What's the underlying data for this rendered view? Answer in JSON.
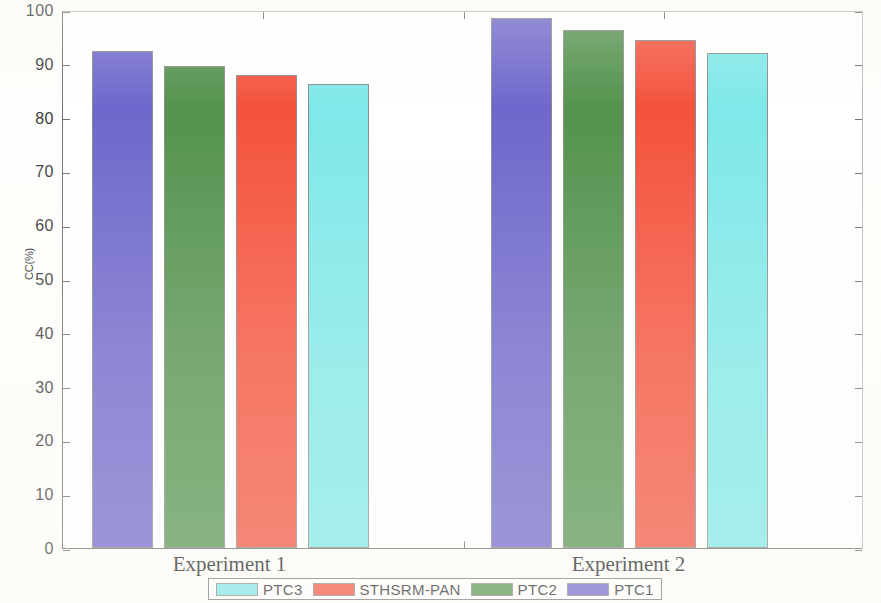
{
  "chart_data": {
    "type": "bar",
    "title": "",
    "xlabel": "",
    "ylabel": "CC(%)",
    "categories": [
      "Experiment 1",
      "Experiment 2"
    ],
    "ylim": [
      0,
      100
    ],
    "yticks": [
      0,
      10,
      20,
      30,
      40,
      50,
      60,
      70,
      80,
      90,
      100
    ],
    "ytick_labels": [
      "0",
      "10",
      "20",
      "30",
      "40",
      "50",
      "60",
      "70",
      "80",
      "90",
      "100"
    ],
    "grid": false,
    "legend_position": "bottom-outside",
    "bar_order_in_group": [
      "PTC1",
      "PTC2",
      "STHSRM-PAN",
      "PTC3"
    ],
    "series": [
      {
        "name": "PTC3",
        "color": "#7FE8E8",
        "values": [
          86.2,
          92.0
        ]
      },
      {
        "name": "STHSRM-PAN",
        "color": "#F4523C",
        "values": [
          88.0,
          94.4
        ]
      },
      {
        "name": "PTC2",
        "color": "#54924E",
        "values": [
          89.6,
          96.3
        ]
      },
      {
        "name": "PTC1",
        "color": "#6F67CB",
        "values": [
          92.3,
          98.5
        ]
      }
    ]
  },
  "axis": {
    "ytick_labels": [
      "100",
      "90",
      "80",
      "70",
      "60",
      "50",
      "40",
      "30",
      "20",
      "10",
      "0"
    ],
    "ylabel": "CC(%)",
    "xcat_1": "Experiment 1",
    "xcat_2": "Experiment 2"
  },
  "legend": {
    "items": [
      {
        "label": "PTC3",
        "color": "#7FE8E8"
      },
      {
        "label": "STHSRM-PAN",
        "color": "#F4523C"
      },
      {
        "label": "PTC2",
        "color": "#54924E"
      },
      {
        "label": "PTC1",
        "color": "#6F67CB"
      }
    ]
  }
}
